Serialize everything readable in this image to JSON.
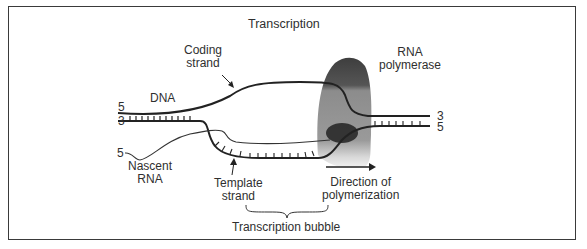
{
  "title": "Transcription",
  "labels": {
    "coding_strand": [
      "Coding",
      "strand"
    ],
    "rna_polymerase": [
      "RNA",
      "polymerase"
    ],
    "dna": "DNA",
    "nascent_rna": [
      "Nascent",
      "RNA"
    ],
    "template_strand": [
      "Template",
      "strand"
    ],
    "direction": [
      "Direction of",
      "polymerization"
    ],
    "bubble": "Transcription bubble"
  },
  "ends": {
    "left_top": "5",
    "left_bottom": "3",
    "rna_start": "5",
    "right_top": "3",
    "right_bottom": "5"
  },
  "colors": {
    "strand": "#222222",
    "polymerase_dark": "#4a4a4a",
    "polymerase_mid": "#8a8a8a",
    "border": "#3a3a3a"
  }
}
